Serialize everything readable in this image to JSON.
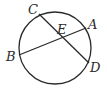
{
  "diagram": {
    "type": "circle-intersecting-chords",
    "circle": {
      "cx": 55,
      "cy": 48,
      "r": 36
    },
    "points": {
      "A": {
        "label": "A",
        "x": 86,
        "y": 28
      },
      "B": {
        "label": "B",
        "x": 19,
        "y": 55
      },
      "C": {
        "label": "C",
        "x": 39,
        "y": 14
      },
      "D": {
        "label": "D",
        "x": 89,
        "y": 63
      },
      "E": {
        "label": "E",
        "x": 61,
        "y": 38
      }
    },
    "chords": [
      {
        "from": "A",
        "to": "B"
      },
      {
        "from": "C",
        "to": "D"
      }
    ],
    "stroke_color": "#2a2a2a"
  }
}
